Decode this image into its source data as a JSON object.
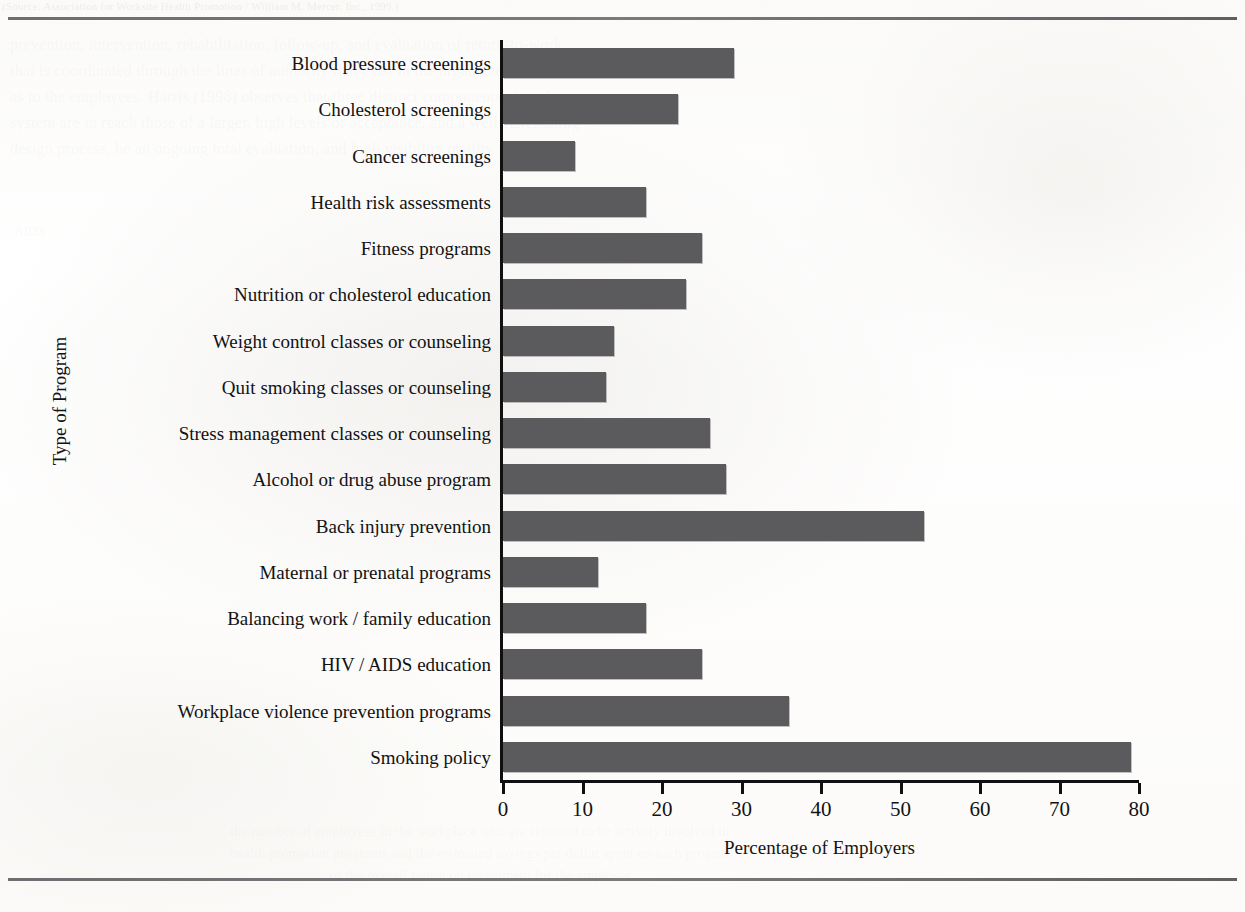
{
  "page": {
    "background_color": "#fdfdfc",
    "bleed_through_lines": [
      {
        "text": "(Source: Association for Worksite Health Promotion / William M. Mercer, Inc., 1999.)",
        "x": 2,
        "y": 0,
        "size": 11,
        "opacity": 0.5
      },
      {
        "text": "prevention, intervention, rehabilitation, follow-up, and evaluation of return-to-work",
        "x": 10,
        "y": 36,
        "size": 16,
        "opacity": 0.16
      },
      {
        "text": "that is coordinated through the lines of authority that exist in the organization as well",
        "x": 10,
        "y": 62,
        "size": 16,
        "opacity": 0.16
      },
      {
        "text": "as to the employees. Harris (1998) observes that three distinct components of such a",
        "x": 10,
        "y": 88,
        "size": 16,
        "opacity": 0.16
      },
      {
        "text": "system are in reach those of a larger, high levels of acceptance, and a well-functioning",
        "x": 10,
        "y": 114,
        "size": 16,
        "opacity": 0.16
      },
      {
        "text": "design process, be an ongoing total evaluation, and high visibility quality assurance",
        "x": 10,
        "y": 140,
        "size": 16,
        "opacity": 0.16
      },
      {
        "text": "AIDS",
        "x": 14,
        "y": 223,
        "size": 13,
        "opacity": 0.17
      },
      {
        "text": "the number of employees in the workplace who are reported to be actively involved in",
        "x": 230,
        "y": 824,
        "size": 14,
        "opacity": 0.15
      },
      {
        "text": "health promotion programs and the estimated savings per dollar spent on each program",
        "x": 230,
        "y": 846,
        "size": 14,
        "opacity": 0.15
      },
      {
        "text": "or the overall return on investment for the employer.",
        "x": 330,
        "y": 868,
        "size": 14,
        "opacity": 0.15
      }
    ]
  },
  "chart_data": {
    "type": "bar",
    "orientation": "horizontal",
    "title": "",
    "xlabel": "Percentage of Employers",
    "ylabel": "Type of Program",
    "xlim": [
      0,
      80
    ],
    "xticks": [
      0,
      10,
      20,
      30,
      40,
      50,
      60,
      70,
      80
    ],
    "grid": false,
    "legend": "none",
    "bar_color": "#5b5b5d",
    "axis_color": "#101010",
    "categories": [
      "Blood pressure screenings",
      "Cholesterol screenings",
      "Cancer screenings",
      "Health risk assessments",
      "Fitness programs",
      "Nutrition or cholesterol education",
      "Weight control classes or counseling",
      "Quit smoking classes or counseling",
      "Stress management classes or counseling",
      "Alcohol or drug abuse program",
      "Back injury prevention",
      "Maternal or prenatal programs",
      "Balancing work / family education",
      "HIV / AIDS education",
      "Workplace violence prevention programs",
      "Smoking policy"
    ],
    "values": [
      29,
      22,
      9,
      18,
      25,
      23,
      14,
      13,
      26,
      28,
      53,
      12,
      18,
      25,
      36,
      79
    ]
  }
}
